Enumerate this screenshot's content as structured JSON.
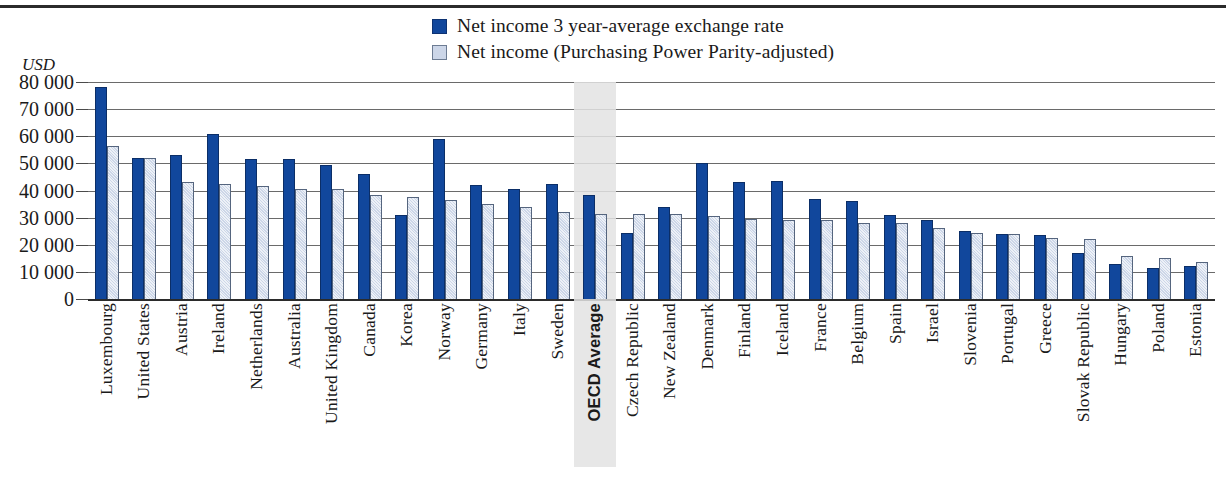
{
  "chart_data": {
    "type": "bar",
    "title": "",
    "subtitle": "",
    "xlabel": "",
    "ylabel": "USD",
    "ylim": [
      0,
      80000
    ],
    "ytick_labels": [
      "80 000",
      "70 000",
      "60 000",
      "50 000",
      "40 000",
      "30 000",
      "20 000",
      "10 000",
      "0"
    ],
    "ytick_values": [
      80000,
      70000,
      60000,
      50000,
      40000,
      30000,
      20000,
      10000,
      0
    ],
    "grid": true,
    "legend_position": "top-center",
    "highlight_category": "OECD Average",
    "colors": {
      "series_1": "#11479c",
      "series_2": "#ccd6e8",
      "highlight_band": "#e3e3e3",
      "gridline": "#6a6a6a",
      "axis": "#2b2b2b"
    },
    "categories": [
      "Luxembourg",
      "United States",
      "Austria",
      "Ireland",
      "Netherlands",
      "Australia",
      "United Kingdom",
      "Canada",
      "Korea",
      "Norway",
      "Germany",
      "Italy",
      "Sweden",
      "OECD Average",
      "Czech Republic",
      "New Zealand",
      "Denmark",
      "Finland",
      "Iceland",
      "France",
      "Belgium",
      "Spain",
      "Israel",
      "Slovenia",
      "Portugal",
      "Greece",
      "Slovak Republic",
      "Hungary",
      "Poland",
      "Estonia"
    ],
    "series": [
      {
        "name": "Net income 3 year-average exchange rate",
        "color": "#11479c",
        "values": [
          78000,
          52000,
          53000,
          61000,
          51500,
          51500,
          49500,
          46000,
          31000,
          59000,
          42000,
          40500,
          42500,
          38500,
          24500,
          34000,
          50000,
          43000,
          43500,
          37000,
          36000,
          31000,
          29000,
          25000,
          24000,
          23500,
          17000,
          13000,
          11500,
          12000
        ]
      },
      {
        "name": "Net income (Purchasing Power Parity-adjusted)",
        "color": "#ccd6e8",
        "values": [
          56500,
          52000,
          43000,
          42500,
          41500,
          40500,
          40500,
          38500,
          37500,
          36500,
          35000,
          34000,
          32000,
          31500,
          31500,
          31500,
          30500,
          29500,
          29000,
          29000,
          28000,
          28000,
          26000,
          24500,
          24000,
          22500,
          22000,
          16000,
          15000,
          13500
        ]
      }
    ]
  },
  "legend": {
    "items": [
      {
        "label": "Net income 3 year-average exchange rate",
        "swatch": "dark"
      },
      {
        "label": "Net income (Purchasing Power Parity-adjusted)",
        "swatch": "light"
      }
    ]
  },
  "axis": {
    "unit_label": "USD"
  }
}
